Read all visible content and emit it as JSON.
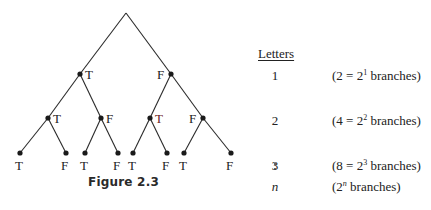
{
  "figure": {
    "caption": "Figure 2.3",
    "tree": {
      "root": {
        "x": 126,
        "y": 13
      },
      "level1": [
        {
          "x": 80,
          "y": 74,
          "label": "T",
          "label_side": "right"
        },
        {
          "x": 171,
          "y": 74,
          "label": "F",
          "label_side": "left"
        }
      ],
      "level2": [
        {
          "x": 48,
          "y": 118,
          "label": "T",
          "label_side": "right",
          "parent": 0
        },
        {
          "x": 101,
          "y": 118,
          "label": "F",
          "label_side": "right",
          "parent": 0
        },
        {
          "x": 150,
          "y": 118,
          "label": "T",
          "label_side": "right",
          "parent": 1
        },
        {
          "x": 203,
          "y": 118,
          "label": "F",
          "label_side": "left",
          "parent": 1
        }
      ],
      "level3": [
        {
          "x": 20,
          "y": 153,
          "label": "T",
          "parent": 0
        },
        {
          "x": 66,
          "y": 153,
          "label": "F",
          "parent": 0
        },
        {
          "x": 85,
          "y": 153,
          "label": "T",
          "parent": 1
        },
        {
          "x": 118,
          "y": 153,
          "label": "F",
          "parent": 1
        },
        {
          "x": 133,
          "y": 153,
          "label": "T",
          "parent": 2
        },
        {
          "x": 167,
          "y": 153,
          "label": "F",
          "parent": 2
        },
        {
          "x": 184,
          "y": 153,
          "label": "T",
          "parent": 3
        },
        {
          "x": 231,
          "y": 153,
          "label": "F",
          "parent": 3
        }
      ]
    }
  },
  "table": {
    "header": "Letters",
    "rows": [
      {
        "letters": "1",
        "prefix": "(2 = 2",
        "exp": "1",
        "suffix": " branches)"
      },
      {
        "letters": "2",
        "prefix": "(4 = 2",
        "exp": "2",
        "suffix": " branches)"
      },
      {
        "letters": "3",
        "prefix": "(8 = 2",
        "exp": "3",
        "suffix": " branches)"
      },
      {
        "letters": "n",
        "prefix": "(2",
        "exp": "n",
        "suffix": " branches)"
      }
    ]
  }
}
